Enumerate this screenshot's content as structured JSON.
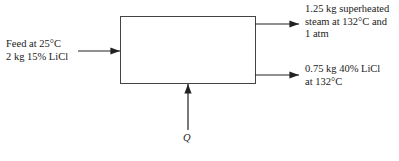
{
  "diagram": {
    "type": "process-flow",
    "process_box": {
      "label": ""
    },
    "inputs": [
      {
        "id": "feed",
        "lines": [
          "Feed at 25°C",
          "2 kg 15%  LiCl"
        ]
      },
      {
        "id": "heat",
        "lines": [
          "Q"
        ]
      }
    ],
    "outputs": [
      {
        "id": "steam",
        "lines": [
          "1.25 kg superheated",
          "steam at 132°C and",
          "1 atm"
        ]
      },
      {
        "id": "solution",
        "lines": [
          "0.75 kg 40%  LiCl",
          "at 132°C"
        ]
      }
    ]
  }
}
